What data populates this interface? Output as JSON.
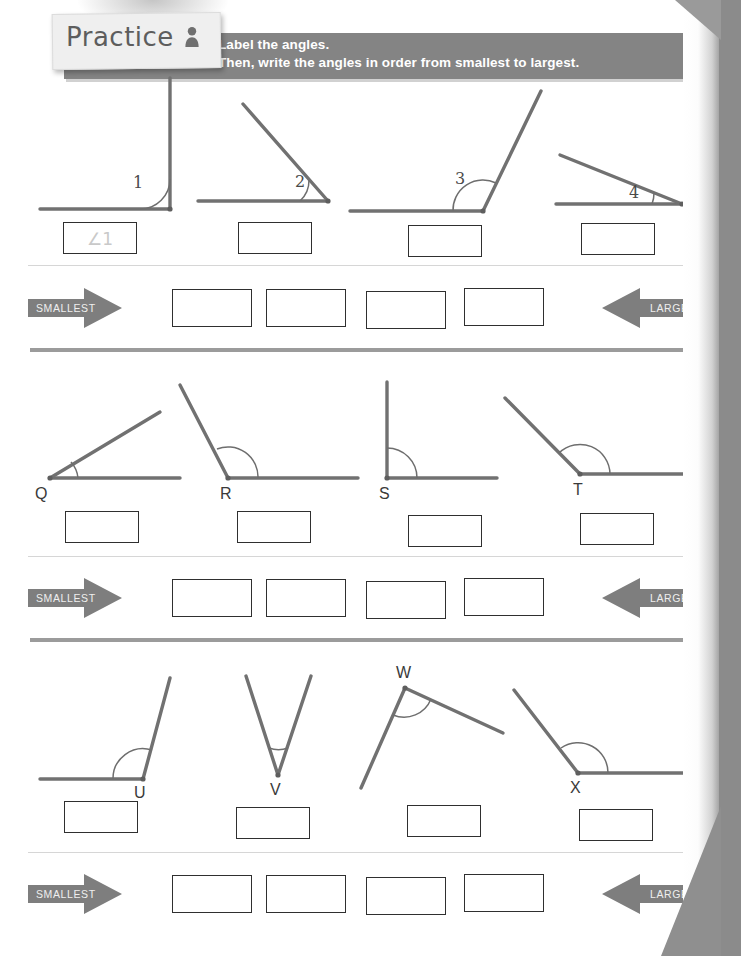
{
  "header": {
    "tab_label": "Practice",
    "tab_icon": "person-icon",
    "instruction_line1": "Label the angles.",
    "instruction_line2": "Then, write the angles in order from smallest to largest.",
    "bar_color": "#848484",
    "tab_color": "#efefef",
    "text_color": "#ffffff"
  },
  "order_row_labels": {
    "smallest": "SMALLEST",
    "largest": "LARGEST",
    "arrow_color": "#7e7e7e"
  },
  "sections": [
    {
      "id": "section-1",
      "figures": [
        {
          "label": "1",
          "label_kind": "number",
          "answer": "∠1",
          "answer_filled": true
        },
        {
          "label": "2",
          "label_kind": "number",
          "answer": "",
          "answer_filled": false
        },
        {
          "label": "3",
          "label_kind": "number",
          "answer": "",
          "answer_filled": false
        },
        {
          "label": "4",
          "label_kind": "number",
          "answer": "",
          "answer_filled": false
        }
      ],
      "order_boxes": [
        "",
        "",
        "",
        ""
      ]
    },
    {
      "id": "section-2",
      "figures": [
        {
          "label": "Q",
          "label_kind": "letter",
          "answer": "",
          "answer_filled": false
        },
        {
          "label": "R",
          "label_kind": "letter",
          "answer": "",
          "answer_filled": false
        },
        {
          "label": "S",
          "label_kind": "letter",
          "answer": "",
          "answer_filled": false
        },
        {
          "label": "T",
          "label_kind": "letter",
          "answer": "",
          "answer_filled": false
        }
      ],
      "order_boxes": [
        "",
        "",
        "",
        ""
      ]
    },
    {
      "id": "section-3",
      "figures": [
        {
          "label": "U",
          "label_kind": "letter",
          "answer": "",
          "answer_filled": false
        },
        {
          "label": "V",
          "label_kind": "letter",
          "answer": "",
          "answer_filled": false
        },
        {
          "label": "W",
          "label_kind": "letter",
          "answer": "",
          "answer_filled": false
        },
        {
          "label": "X",
          "label_kind": "letter",
          "answer": "",
          "answer_filled": false
        }
      ],
      "order_boxes": [
        "",
        "",
        "",
        ""
      ]
    }
  ],
  "colors": {
    "ray_stroke": "#717171",
    "box_border": "#2f2f2f",
    "divider": "#9b9b9b",
    "page_background": "#ffffff"
  }
}
